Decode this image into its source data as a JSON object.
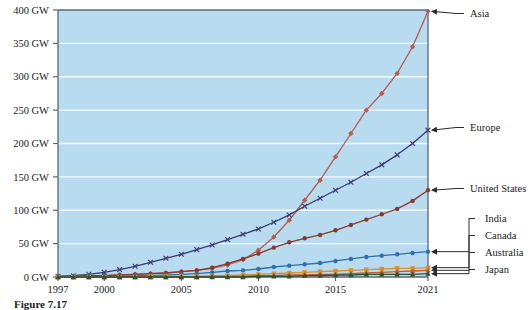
{
  "chart_data": {
    "type": "line",
    "title": "",
    "xlabel": "",
    "ylabel": "",
    "unit": "GW",
    "grid": true,
    "legend_position": "right-inline-labels",
    "plot_background": "#b8dbef",
    "gridline_color": "#f4fcff",
    "axis_color": "#5c6672",
    "xlim": [
      1997,
      2021
    ],
    "ylim": [
      0,
      400
    ],
    "x": [
      1997,
      1998,
      1999,
      2000,
      2001,
      2002,
      2003,
      2004,
      2005,
      2006,
      2007,
      2008,
      2009,
      2010,
      2011,
      2012,
      2013,
      2014,
      2015,
      2016,
      2017,
      2018,
      2019,
      2020,
      2021
    ],
    "ytick_labels": [
      "0 GW",
      "50 GW",
      "100 GW",
      "150 GW",
      "200 GW",
      "250 GW",
      "300 GW",
      "350 GW",
      "400 GW"
    ],
    "ytick_values": [
      0,
      50,
      100,
      150,
      200,
      250,
      300,
      350,
      400
    ],
    "xtick_labels": [
      "1997",
      "2000",
      "2005",
      "2010",
      "2015",
      "2021"
    ],
    "xtick_values": [
      1997,
      2000,
      2005,
      2010,
      2015,
      2021
    ],
    "series": [
      {
        "name": "Asia",
        "label": "Asia",
        "color": "#b75b50",
        "marker": "diamond",
        "values": [
          1,
          1,
          2,
          2,
          3,
          4,
          5,
          6,
          8,
          10,
          13,
          18,
          26,
          40,
          60,
          85,
          115,
          145,
          180,
          215,
          250,
          275,
          305,
          345,
          398
        ]
      },
      {
        "name": "Europe",
        "label": "Europe",
        "color": "#3c3a6b",
        "marker": "cross",
        "values": [
          1,
          2,
          4,
          7,
          11,
          16,
          22,
          28,
          34,
          41,
          48,
          56,
          64,
          72,
          82,
          93,
          106,
          118,
          130,
          142,
          155,
          168,
          183,
          200,
          220
        ]
      },
      {
        "name": "United States",
        "label": "United States",
        "color": "#8a3a2c",
        "marker": "circle",
        "values": [
          1,
          1,
          2,
          2,
          3,
          4,
          5,
          6,
          8,
          10,
          14,
          20,
          27,
          35,
          44,
          52,
          58,
          63,
          70,
          78,
          86,
          94,
          102,
          114,
          130
        ]
      },
      {
        "name": "India",
        "label": "India",
        "color": "#2f6fad",
        "marker": "circle",
        "values": [
          0,
          0,
          1,
          1,
          1,
          2,
          2,
          3,
          4,
          5,
          7,
          9,
          10,
          12,
          15,
          17,
          19,
          21,
          24,
          27,
          30,
          32,
          34,
          36,
          38
        ]
      },
      {
        "name": "Canada",
        "label": "Canada",
        "color": "#d8922f",
        "marker": "square",
        "values": [
          0,
          0,
          0,
          0,
          0,
          0,
          1,
          1,
          1,
          1,
          2,
          2,
          3,
          4,
          5,
          6,
          7,
          8,
          9,
          10,
          11,
          12,
          13,
          13,
          14
        ]
      },
      {
        "name": "Australia",
        "label": "Australia",
        "color": "#c25b2c",
        "marker": "triangle",
        "values": [
          0,
          0,
          0,
          0,
          0,
          0,
          0,
          0,
          0,
          0,
          1,
          1,
          1,
          2,
          2,
          3,
          3,
          4,
          4,
          5,
          6,
          7,
          8,
          9,
          10
        ]
      },
      {
        "name": "Japan",
        "label": "Japan",
        "color": "#2c5234",
        "marker": "triangle",
        "values": [
          0,
          0,
          0,
          0,
          0,
          0,
          0,
          0,
          0,
          0,
          0,
          0,
          0,
          1,
          1,
          1,
          2,
          2,
          3,
          3,
          4,
          4,
          4,
          4,
          5
        ]
      }
    ]
  },
  "caption": {
    "text": "Figure 7.17"
  }
}
